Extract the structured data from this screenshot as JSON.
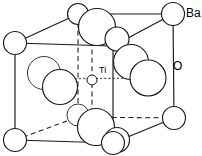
{
  "figure": {
    "name": "barium-titanate-unit-cell",
    "background_color": "#ffffff",
    "line_color": "#1a1a1a",
    "atom_fill_color": "#ffffff",
    "width": 202,
    "height": 156
  },
  "labels": {
    "barium": "Ba",
    "oxygen": "O",
    "titanium": "Ti"
  },
  "label_positions": {
    "barium": {
      "x": 186,
      "y": 14
    },
    "oxygen": {
      "x": 173,
      "y": 67
    },
    "titanium": {
      "x": 99,
      "y": 71
    }
  },
  "cube": {
    "vertices": {
      "front_top_left": {
        "x": 15,
        "y": 43
      },
      "front_top_right": {
        "x": 113,
        "y": 46
      },
      "front_bottom_left": {
        "x": 15,
        "y": 140
      },
      "front_bottom_right": {
        "x": 113,
        "y": 143
      },
      "back_top_left": {
        "x": 78,
        "y": 14
      },
      "back_top_right": {
        "x": 173,
        "y": 14
      },
      "back_bottom_left": {
        "x": 78,
        "y": 117
      },
      "back_bottom_right": {
        "x": 174,
        "y": 118
      }
    },
    "solid_edges": [
      [
        "front_top_left",
        "front_top_right"
      ],
      [
        "front_top_left",
        "front_bottom_left"
      ],
      [
        "front_bottom_left",
        "front_bottom_right"
      ],
      [
        "front_bottom_right",
        "front_top_right"
      ],
      [
        "front_top_left",
        "back_top_left"
      ],
      [
        "front_top_right",
        "back_top_right"
      ],
      [
        "back_top_left",
        "back_top_right"
      ],
      [
        "back_top_right",
        "back_bottom_right"
      ],
      [
        "front_bottom_right",
        "back_bottom_right"
      ]
    ],
    "dashed_edges": [
      [
        "back_top_left",
        "back_bottom_left"
      ],
      [
        "back_bottom_left",
        "back_bottom_right"
      ],
      [
        "front_bottom_left",
        "back_bottom_left"
      ]
    ]
  },
  "atoms": [
    {
      "id": "ba-front-top-left",
      "element": "Ba",
      "x": 15,
      "y": 43,
      "r": 11.5,
      "style": "solid"
    },
    {
      "id": "ba-front-bottom-left",
      "element": "Ba",
      "x": 15,
      "y": 140,
      "r": 11.5,
      "style": "solid"
    },
    {
      "id": "ba-front-bottom-right",
      "element": "Ba",
      "x": 113,
      "y": 143,
      "r": 11.5,
      "style": "solid"
    },
    {
      "id": "ba-back-top-left",
      "element": "Ba",
      "x": 78,
      "y": 14,
      "r": 10.5,
      "style": "solid"
    },
    {
      "id": "ba-back-top-right",
      "element": "Ba",
      "x": 173,
      "y": 14,
      "r": 11.5,
      "style": "solid"
    },
    {
      "id": "ba-back-bottom-left",
      "element": "Ba",
      "x": 78,
      "y": 117,
      "r": 10.5,
      "style": "solid"
    },
    {
      "id": "ba-back-bottom-right",
      "element": "Ba",
      "x": 174,
      "y": 118,
      "r": 11.5,
      "style": "solid"
    },
    {
      "id": "o-top-face",
      "element": "O",
      "x": 97,
      "y": 27,
      "r": 18.5,
      "style": "solid"
    },
    {
      "id": "o-top-right-face",
      "element": "O",
      "x": 117,
      "y": 39,
      "r": 12.0,
      "style": "solid"
    },
    {
      "id": "o-left-face-back",
      "element": "O",
      "x": 44,
      "y": 73,
      "r": 16.5,
      "style": "thin"
    },
    {
      "id": "o-left-face-front",
      "element": "O",
      "x": 60,
      "y": 87,
      "r": 17.5,
      "style": "solid"
    },
    {
      "id": "o-right-face-back",
      "element": "O",
      "x": 131,
      "y": 62,
      "r": 17.5,
      "style": "solid"
    },
    {
      "id": "o-right-face-front",
      "element": "O",
      "x": 148,
      "y": 78,
      "r": 18.0,
      "style": "solid"
    },
    {
      "id": "o-bottom-face",
      "element": "O",
      "x": 96,
      "y": 127,
      "r": 18.5,
      "style": "solid"
    },
    {
      "id": "o-bottom-left-small",
      "element": "O",
      "x": 78,
      "y": 115,
      "r": 11.0,
      "style": "thin"
    },
    {
      "id": "o-bottom-right-small",
      "element": "O",
      "x": 117,
      "y": 140,
      "r": 12.5,
      "style": "solid"
    },
    {
      "id": "ti-body-centre",
      "element": "Ti",
      "x": 92,
      "y": 80,
      "r": 5.0,
      "style": "centre"
    }
  ],
  "bonds": [
    {
      "from": {
        "x": 58,
        "y": 79
      },
      "to": {
        "x": 133,
        "y": 78
      },
      "kind": "dotted-horizontal"
    },
    {
      "from": {
        "x": 92,
        "y": 41
      },
      "to": {
        "x": 92,
        "y": 122
      },
      "kind": "dashed-vertical"
    }
  ]
}
